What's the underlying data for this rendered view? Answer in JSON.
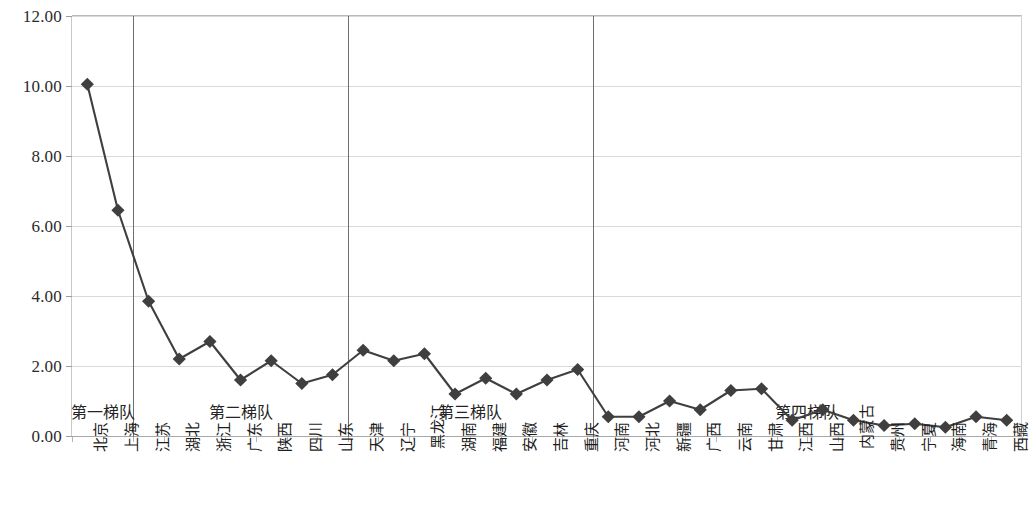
{
  "chart_data": {
    "type": "line",
    "title": "",
    "subtitle": "",
    "xlabel": "",
    "ylabel": "",
    "ylim": [
      0,
      12
    ],
    "ytick_step": 2,
    "ytick_labels": [
      "0.00",
      "2.00",
      "4.00",
      "6.00",
      "8.00",
      "10.00",
      "12.00"
    ],
    "grid": true,
    "legend": "none",
    "marker": "diamond",
    "series_color": "#3f3f3f",
    "categories": [
      "北京",
      "上海",
      "江苏",
      "湖北",
      "浙江",
      "广东",
      "陕西",
      "四川",
      "山东",
      "天津",
      "辽宁",
      "黑龙江",
      "湖南",
      "福建",
      "安徽",
      "吉林",
      "重庆",
      "河南",
      "河北",
      "新疆",
      "广西",
      "云南",
      "甘肃",
      "江西",
      "山西",
      "内蒙古",
      "贵州",
      "宁夏",
      "海南",
      "青海",
      "西藏"
    ],
    "values": [
      10.05,
      6.45,
      3.85,
      2.2,
      2.7,
      1.6,
      2.15,
      1.5,
      1.75,
      2.45,
      2.15,
      2.35,
      1.2,
      1.65,
      1.2,
      1.6,
      1.9,
      0.55,
      0.55,
      1.0,
      0.75,
      1.3,
      1.35,
      0.45,
      0.75,
      0.45,
      0.3,
      0.35,
      0.25,
      0.55,
      0.45
    ],
    "series": [
      {
        "name": "",
        "values": [
          10.05,
          6.45,
          3.85,
          2.2,
          2.7,
          1.6,
          2.15,
          1.5,
          1.75,
          2.45,
          2.15,
          2.35,
          1.2,
          1.65,
          1.2,
          1.6,
          1.9,
          0.55,
          0.55,
          1.0,
          0.75,
          1.3,
          1.35,
          0.45,
          0.75,
          0.45,
          0.3,
          0.35,
          0.25,
          0.55,
          0.45
        ]
      }
    ],
    "annotations": [
      {
        "text": "第一梯队",
        "start_index": 0,
        "end_index": 1
      },
      {
        "text": "第二梯队",
        "start_index": 2,
        "end_index": 8
      },
      {
        "text": "第三梯队",
        "start_index": 9,
        "end_index": 16
      },
      {
        "text": "第四梯队",
        "start_index": 17,
        "end_index": 30
      }
    ],
    "dividers_after_index": [
      1,
      8,
      16
    ]
  }
}
